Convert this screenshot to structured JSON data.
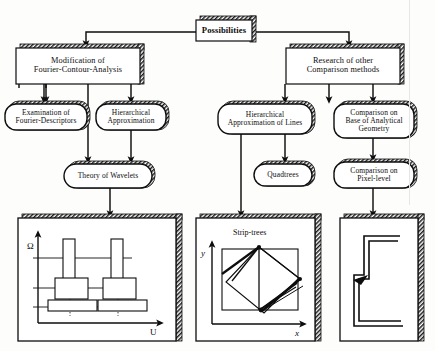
{
  "diagram": {
    "title": "Possibilities",
    "root": {
      "label": "Possibilities"
    },
    "level1": [
      {
        "id": "mod-fca",
        "label": "Modification of\nFourier-Contour-Analysis"
      },
      {
        "id": "res-comp",
        "label": "Research of other\nComparison methods"
      }
    ],
    "level2": [
      {
        "id": "exam-fd",
        "label": "Examination of\nFourier-Descriptors"
      },
      {
        "id": "hier-appr",
        "label": "Hierarchical\nApproximation"
      },
      {
        "id": "hier-lines",
        "label": "Hierarchical\nApproximation of Lines"
      },
      {
        "id": "comp-anal",
        "label": "Comparison on\nBase of Analytical\nGeometry"
      }
    ],
    "level3": [
      {
        "id": "wavelets",
        "label": "Theory of Wavelets"
      },
      {
        "id": "quadtrees",
        "label": "Quadtrees"
      },
      {
        "id": "comp-pixel",
        "label": "Comparison on\nPixel-level"
      }
    ],
    "panels": [
      {
        "id": "panel-wavelet",
        "caption": "",
        "x_axis": "U",
        "y_axis": "Ω"
      },
      {
        "id": "panel-striptree",
        "caption": "Strip-trees",
        "x_axis": "x",
        "y_axis": "y"
      },
      {
        "id": "panel-pixel",
        "caption": "",
        "x_axis": "",
        "y_axis": ""
      }
    ],
    "colors": {
      "ink": "#0d0d0d",
      "paper": "#fdfdfc",
      "shadow_hatch": "#1a1a1a",
      "box_fill": "#ffffff"
    }
  }
}
